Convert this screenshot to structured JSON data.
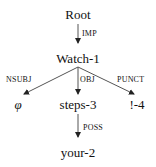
{
  "diagram": {
    "type": "dependency-tree",
    "nodes": {
      "root": "Root",
      "watch": "Watch-1",
      "phi": "φ",
      "steps": "steps-3",
      "punct": "!-4",
      "your": "your-2"
    },
    "edges": {
      "root_watch": "IMP",
      "watch_phi": "NSUBJ",
      "watch_steps": "OBJ",
      "watch_punct": "PUNCT",
      "steps_your": "POSS"
    },
    "colors": {
      "text": "#111111",
      "edge": "#555555",
      "arrowhead": "#222222"
    }
  }
}
